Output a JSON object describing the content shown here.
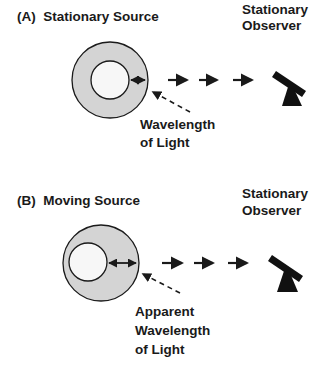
{
  "panel_a": {
    "title": "(A)  Stationary Source",
    "observer_line1": "Stationary",
    "observer_line2": "Observer",
    "callout_line1": "Wavelength",
    "callout_line2": "of Light",
    "source_icon": "concentric-circles-source",
    "observer_icon": "telescope-icon"
  },
  "panel_b": {
    "title": "(B)  Moving Source",
    "observer_line1": "Stationary",
    "observer_line2": "Observer",
    "callout_line1": "Apparent",
    "callout_line2": "Wavelength",
    "callout_line3": "of Light",
    "source_icon": "offset-circles-source",
    "observer_icon": "telescope-icon"
  },
  "colors": {
    "ring_fill": "#d4d4d4",
    "inner_fill": "#f7f7f7",
    "stroke": "#1a1a1a",
    "background": "#ffffff"
  }
}
